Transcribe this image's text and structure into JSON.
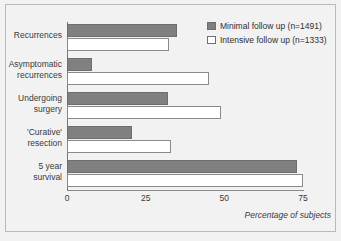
{
  "chart_data": {
    "type": "bar",
    "orientation": "horizontal",
    "title": "",
    "xlabel": "Percentage of subjects",
    "ylabel": "",
    "xlim": [
      0,
      75
    ],
    "xticks": [
      "0",
      "25",
      "50",
      "75"
    ],
    "xtick_values": [
      0,
      25,
      50,
      75
    ],
    "grid": false,
    "legend_position": "top-right",
    "categories": [
      "Recurrences",
      "Asymptomatic recurrences",
      "Undergoing surgery",
      "'Curative' resection",
      "5 year survival"
    ],
    "category_lines": [
      [
        "Recurrences"
      ],
      [
        "Asymptomatic",
        "recurrences"
      ],
      [
        "Undergoing",
        "surgery"
      ],
      [
        "'Curative'",
        "resection"
      ],
      [
        "5 year",
        "survival"
      ]
    ],
    "series": [
      {
        "name": "Minimal follow up (n=1491)",
        "color": "#808080",
        "values": [
          35,
          8,
          32,
          20.5,
          73
        ]
      },
      {
        "name": "Intensive follow up (n=1333)",
        "color": "#ffffff",
        "values": [
          32.5,
          45,
          49,
          33,
          75
        ]
      }
    ]
  },
  "legend": {
    "items": [
      {
        "label": "Minimal follow up (n=1491)"
      },
      {
        "label": "Intensive follow up (n=1333)"
      }
    ]
  },
  "axis": {
    "caption": "Percentage of subjects"
  }
}
